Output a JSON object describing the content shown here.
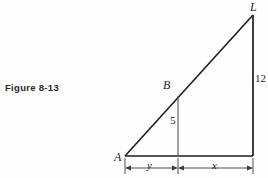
{
  "figure": {
    "caption": "Figure 8-13",
    "ink_color": "#1d1d1d",
    "background_color": "#fefefe"
  },
  "diagram": {
    "type": "right-triangle-geometry",
    "vertices": {
      "A": {
        "label": "A"
      },
      "B": {
        "label": "B"
      },
      "L": {
        "label": "L"
      }
    },
    "measures": {
      "vertical_leg_right": "12",
      "vertical_segment_mid": "5"
    },
    "dimensions": {
      "left_segment": "y",
      "right_segment": "x"
    }
  }
}
